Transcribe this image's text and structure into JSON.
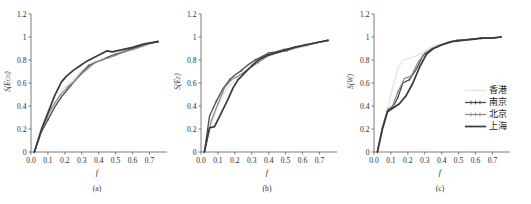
{
  "figure": {
    "panel_count": 3,
    "background": "#ffffff"
  },
  "legend": {
    "position": "inside-right of panel (c)",
    "items": [
      {
        "label": "香港",
        "color": "#e2e2e2",
        "width": 1.2,
        "marker": "none"
      },
      {
        "label": "南京",
        "color": "#4a4a4a",
        "width": 1.3,
        "marker": "tick"
      },
      {
        "label": "北京",
        "color": "#8c8c8c",
        "width": 1.2,
        "marker": "tick"
      },
      {
        "label": "上海",
        "color": "#3a3a3a",
        "width": 1.7,
        "marker": "none"
      }
    ]
  },
  "chart_data": [
    {
      "type": "line",
      "title": "",
      "caption": "(a)",
      "xlabel": "f",
      "ylabel": "S(E",
      "ylabel_sub": "CO",
      "ylabel_tail": ")",
      "xlim": [
        0.0,
        0.78
      ],
      "ylim": [
        0,
        1.2
      ],
      "xticks": [
        "0.0",
        "0.1",
        "0.2",
        "0.3",
        "0.4",
        "0.5",
        "0.6",
        "0.7"
      ],
      "xtick_values": [
        0.0,
        0.1,
        0.2,
        0.3,
        0.4,
        0.5,
        0.6,
        0.7
      ],
      "yticks": [
        "0",
        "0.2",
        "0.4",
        "0.6",
        "0.8",
        "1",
        "1.2"
      ],
      "ytick_values": [
        0,
        0.2,
        0.4,
        0.6,
        0.8,
        1.0,
        1.2
      ],
      "grid": false,
      "series": [
        {
          "name": "香港",
          "color": "#e2e2e2",
          "width": 1.2,
          "marker": "none",
          "x": [
            0.02,
            0.07,
            0.11,
            0.15,
            0.19,
            0.23,
            0.27,
            0.31,
            0.35,
            0.39,
            0.43,
            0.47,
            0.51,
            0.57,
            0.63,
            0.69,
            0.75
          ],
          "y": [
            0.0,
            0.21,
            0.33,
            0.44,
            0.55,
            0.6,
            0.66,
            0.72,
            0.77,
            0.79,
            0.81,
            0.83,
            0.85,
            0.88,
            0.91,
            0.94,
            0.96
          ]
        },
        {
          "name": "南京",
          "color": "#4a4a4a",
          "width": 1.3,
          "marker": "tick",
          "x": [
            0.02,
            0.06,
            0.1,
            0.14,
            0.18,
            0.22,
            0.26,
            0.3,
            0.34,
            0.38,
            0.42,
            0.46,
            0.5,
            0.56,
            0.62,
            0.68,
            0.75
          ],
          "y": [
            0.0,
            0.17,
            0.28,
            0.39,
            0.48,
            0.55,
            0.62,
            0.69,
            0.75,
            0.78,
            0.8,
            0.83,
            0.85,
            0.88,
            0.91,
            0.94,
            0.96
          ]
        },
        {
          "name": "北京",
          "color": "#8c8c8c",
          "width": 1.2,
          "marker": "tick",
          "x": [
            0.02,
            0.07,
            0.12,
            0.17,
            0.22,
            0.26,
            0.3,
            0.34,
            0.38,
            0.42,
            0.46,
            0.5,
            0.55,
            0.6,
            0.66,
            0.7,
            0.75
          ],
          "y": [
            0.0,
            0.22,
            0.38,
            0.49,
            0.57,
            0.62,
            0.68,
            0.73,
            0.78,
            0.8,
            0.82,
            0.84,
            0.87,
            0.89,
            0.92,
            0.94,
            0.96
          ]
        },
        {
          "name": "上海",
          "color": "#3a3a3a",
          "width": 1.7,
          "marker": "none",
          "x": [
            0.02,
            0.06,
            0.1,
            0.14,
            0.18,
            0.21,
            0.25,
            0.29,
            0.33,
            0.37,
            0.41,
            0.45,
            0.48,
            0.54,
            0.6,
            0.67,
            0.75
          ],
          "y": [
            0.0,
            0.19,
            0.34,
            0.49,
            0.61,
            0.66,
            0.71,
            0.75,
            0.79,
            0.82,
            0.85,
            0.88,
            0.87,
            0.89,
            0.91,
            0.94,
            0.96
          ]
        }
      ]
    },
    {
      "type": "line",
      "title": "",
      "caption": "(b)",
      "xlabel": "f",
      "ylabel": "S(E",
      "ylabel_sub": "E",
      "ylabel_tail": ")",
      "xlim": [
        0.0,
        0.78
      ],
      "ylim": [
        0,
        1.2
      ],
      "xticks": [
        "0.0",
        "0.1",
        "0.2",
        "0.3",
        "0.4",
        "0.5",
        "0.6",
        "0.7"
      ],
      "xtick_values": [
        0.0,
        0.1,
        0.2,
        0.3,
        0.4,
        0.5,
        0.6,
        0.7
      ],
      "yticks": [
        "0",
        "0.2",
        "0.4",
        "0.6",
        "0.8",
        "1",
        "1.2"
      ],
      "ytick_values": [
        0,
        0.2,
        0.4,
        0.6,
        0.8,
        1.0,
        1.2
      ],
      "grid": false,
      "series": [
        {
          "name": "香港",
          "color": "#e2e2e2",
          "width": 1.2,
          "marker": "none",
          "x": [
            0.02,
            0.06,
            0.1,
            0.13,
            0.17,
            0.21,
            0.25,
            0.29,
            0.33,
            0.37,
            0.41,
            0.45,
            0.5,
            0.56,
            0.62,
            0.68,
            0.75
          ],
          "y": [
            0.0,
            0.24,
            0.4,
            0.5,
            0.58,
            0.64,
            0.69,
            0.74,
            0.79,
            0.82,
            0.85,
            0.87,
            0.88,
            0.9,
            0.92,
            0.95,
            0.97
          ]
        },
        {
          "name": "南京",
          "color": "#4a4a4a",
          "width": 1.3,
          "marker": "tick",
          "x": [
            0.02,
            0.05,
            0.09,
            0.13,
            0.17,
            0.2,
            0.24,
            0.28,
            0.32,
            0.36,
            0.4,
            0.44,
            0.49,
            0.55,
            0.62,
            0.68,
            0.75
          ],
          "y": [
            0.0,
            0.31,
            0.44,
            0.55,
            0.63,
            0.67,
            0.71,
            0.76,
            0.8,
            0.83,
            0.86,
            0.87,
            0.89,
            0.91,
            0.93,
            0.95,
            0.97
          ]
        },
        {
          "name": "北京",
          "color": "#8c8c8c",
          "width": 1.2,
          "marker": "tick",
          "x": [
            0.02,
            0.06,
            0.1,
            0.14,
            0.18,
            0.22,
            0.26,
            0.3,
            0.34,
            0.38,
            0.42,
            0.46,
            0.51,
            0.57,
            0.63,
            0.69,
            0.75
          ],
          "y": [
            0.0,
            0.27,
            0.42,
            0.56,
            0.63,
            0.66,
            0.7,
            0.74,
            0.78,
            0.82,
            0.85,
            0.87,
            0.88,
            0.91,
            0.93,
            0.95,
            0.97
          ]
        },
        {
          "name": "上海",
          "color": "#3a3a3a",
          "width": 1.7,
          "marker": "none",
          "x": [
            0.02,
            0.05,
            0.08,
            0.12,
            0.16,
            0.19,
            0.22,
            0.26,
            0.3,
            0.34,
            0.39,
            0.44,
            0.49,
            0.55,
            0.61,
            0.68,
            0.75
          ],
          "y": [
            0.0,
            0.21,
            0.22,
            0.34,
            0.46,
            0.56,
            0.63,
            0.69,
            0.75,
            0.8,
            0.84,
            0.86,
            0.88,
            0.91,
            0.93,
            0.95,
            0.97
          ]
        }
      ]
    },
    {
      "type": "line",
      "title": "",
      "caption": "(c)",
      "xlabel": "f",
      "ylabel": "S(W",
      "ylabel_sub": "",
      "ylabel_tail": ")",
      "xlim": [
        0.0,
        0.78
      ],
      "ylim": [
        0,
        1.2
      ],
      "xticks": [
        "0.0",
        "0.1",
        "0.2",
        "0.3",
        "0.4",
        "0.5",
        "0.6",
        "0.7"
      ],
      "xtick_values": [
        0.0,
        0.1,
        0.2,
        0.3,
        0.4,
        0.5,
        0.6,
        0.7
      ],
      "yticks": [
        "0",
        "0.2",
        "0.4",
        "0.6",
        "0.8",
        "1",
        "1.2"
      ],
      "ytick_values": [
        0,
        0.2,
        0.4,
        0.6,
        0.8,
        1.0,
        1.2
      ],
      "grid": false,
      "series": [
        {
          "name": "香港",
          "color": "#e2e2e2",
          "width": 1.2,
          "marker": "none",
          "x": [
            0.02,
            0.05,
            0.08,
            0.11,
            0.14,
            0.17,
            0.2,
            0.24,
            0.28,
            0.32,
            0.36,
            0.42,
            0.48,
            0.55,
            0.62,
            0.68,
            0.75
          ],
          "y": [
            0.0,
            0.22,
            0.37,
            0.56,
            0.72,
            0.8,
            0.81,
            0.83,
            0.86,
            0.9,
            0.93,
            0.95,
            0.97,
            0.98,
            0.99,
            0.99,
            1.0
          ]
        },
        {
          "name": "南京",
          "color": "#4a4a4a",
          "width": 1.3,
          "marker": "tick",
          "x": [
            0.02,
            0.05,
            0.08,
            0.11,
            0.14,
            0.17,
            0.21,
            0.25,
            0.29,
            0.33,
            0.38,
            0.43,
            0.49,
            0.56,
            0.63,
            0.69,
            0.75
          ],
          "y": [
            0.0,
            0.21,
            0.36,
            0.39,
            0.47,
            0.6,
            0.63,
            0.72,
            0.84,
            0.88,
            0.92,
            0.95,
            0.97,
            0.98,
            0.99,
            0.99,
            1.0
          ]
        },
        {
          "name": "北京",
          "color": "#8c8c8c",
          "width": 1.2,
          "marker": "tick",
          "x": [
            0.02,
            0.05,
            0.08,
            0.11,
            0.14,
            0.18,
            0.22,
            0.26,
            0.3,
            0.34,
            0.39,
            0.45,
            0.51,
            0.58,
            0.64,
            0.7,
            0.75
          ],
          "y": [
            0.0,
            0.22,
            0.37,
            0.4,
            0.52,
            0.64,
            0.66,
            0.78,
            0.86,
            0.9,
            0.93,
            0.96,
            0.97,
            0.98,
            0.99,
            0.99,
            1.0
          ]
        },
        {
          "name": "上海",
          "color": "#3a3a3a",
          "width": 1.7,
          "marker": "none",
          "x": [
            0.02,
            0.05,
            0.08,
            0.11,
            0.15,
            0.19,
            0.23,
            0.27,
            0.31,
            0.35,
            0.4,
            0.46,
            0.52,
            0.58,
            0.64,
            0.7,
            0.75
          ],
          "y": [
            0.0,
            0.2,
            0.35,
            0.38,
            0.42,
            0.49,
            0.6,
            0.74,
            0.85,
            0.9,
            0.93,
            0.96,
            0.97,
            0.98,
            0.99,
            0.99,
            1.0
          ]
        }
      ]
    }
  ]
}
